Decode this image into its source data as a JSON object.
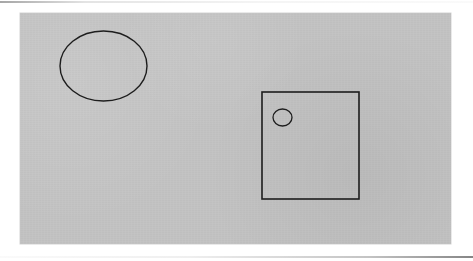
{
  "figure": {
    "page_background": "#ffffff",
    "canvas": {
      "name": "drawing-canvas",
      "fill": "#c3c3c3",
      "x": 20,
      "y": 13,
      "width": 431,
      "height": 231
    },
    "artifacts": [
      {
        "name": "scan-line-top",
        "x": 0,
        "y": 1,
        "width": 473,
        "height": 2,
        "color": "#969696"
      },
      {
        "name": "scan-line-bottom",
        "x": 0,
        "y": 256,
        "width": 473,
        "height": 2,
        "color": "#787878"
      }
    ],
    "shapes": [
      {
        "id": "large-ellipse",
        "label": "Ellipse",
        "type": "ellipse",
        "stroke": "#1d1d1d",
        "stroke_width": 1.4,
        "fill": "none",
        "cx": 103.5,
        "cy": 66,
        "rx": 43.5,
        "ry": 35,
        "bbox": {
          "x": 60,
          "y": 31,
          "width": 87,
          "height": 70
        }
      },
      {
        "id": "main-rectangle",
        "label": "Rectangle",
        "type": "rectangle",
        "stroke": "#1d1d1d",
        "stroke_width": 1.6,
        "fill": "none",
        "bbox": {
          "x": 262,
          "y": 92,
          "width": 97,
          "height": 107
        }
      },
      {
        "id": "small-circle",
        "label": "Small circle",
        "type": "ellipse",
        "stroke": "#1d1d1d",
        "stroke_width": 1.3,
        "fill": "none",
        "cx": 282.5,
        "cy": 117.5,
        "rx": 9.5,
        "ry": 8.5,
        "bbox": {
          "x": 273,
          "y": 109,
          "width": 19,
          "height": 17
        },
        "contained_in": "main-rectangle"
      }
    ]
  }
}
